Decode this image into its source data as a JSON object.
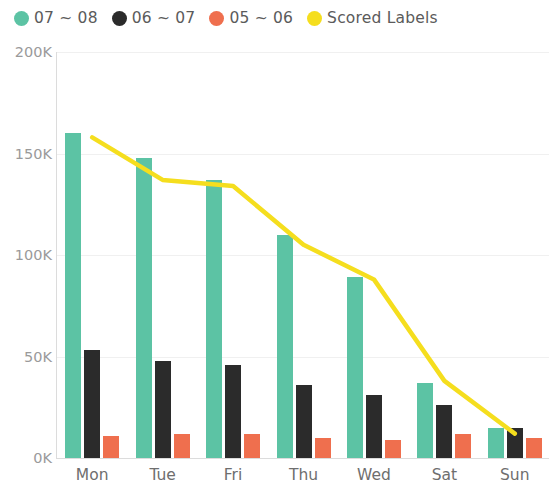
{
  "legend": {
    "items": [
      {
        "label": "07 ~ 08",
        "color": "#5cc3a4",
        "marker": "circle-teal-icon"
      },
      {
        "label": "06 ~ 07",
        "color": "#2b2b2b",
        "marker": "circle-black-icon"
      },
      {
        "label": "05 ~ 06",
        "color": "#ef6f4e",
        "marker": "circle-orange-icon"
      },
      {
        "label": "Scored Labels",
        "color": "#f5de1e",
        "marker": "circle-yellow-icon"
      }
    ]
  },
  "axis": {
    "y_ticks": [
      "200K",
      "150K",
      "100K",
      "50K",
      "0K"
    ],
    "x_ticks": [
      "Mon",
      "Tue",
      "Fri",
      "Thu",
      "Wed",
      "Sat",
      "Sun"
    ]
  },
  "chart_data": {
    "type": "bar",
    "title": "",
    "xlabel": "",
    "ylabel": "",
    "ylim": [
      0,
      200000
    ],
    "yticks": [
      0,
      50000,
      100000,
      150000,
      200000
    ],
    "ytick_labels": [
      "0K",
      "50K",
      "100K",
      "150K",
      "200K"
    ],
    "grid": true,
    "legend_position": "top-left",
    "categories": [
      "Mon",
      "Tue",
      "Fri",
      "Thu",
      "Wed",
      "Sat",
      "Sun"
    ],
    "series": [
      {
        "name": "07 ~ 08",
        "type": "bar",
        "color": "#5cc3a4",
        "values": [
          160000,
          148000,
          137000,
          110000,
          89000,
          37000,
          15000
        ]
      },
      {
        "name": "06 ~ 07",
        "type": "bar",
        "color": "#2b2b2b",
        "values": [
          53000,
          48000,
          46000,
          36000,
          31000,
          26000,
          15000
        ]
      },
      {
        "name": "05 ~ 06",
        "type": "bar",
        "color": "#ef6f4e",
        "values": [
          11000,
          12000,
          12000,
          10000,
          9000,
          12000,
          10000
        ]
      },
      {
        "name": "Scored Labels",
        "type": "line",
        "color": "#f5de1e",
        "values": [
          158000,
          137000,
          134000,
          105000,
          88000,
          38000,
          12000
        ]
      }
    ]
  }
}
